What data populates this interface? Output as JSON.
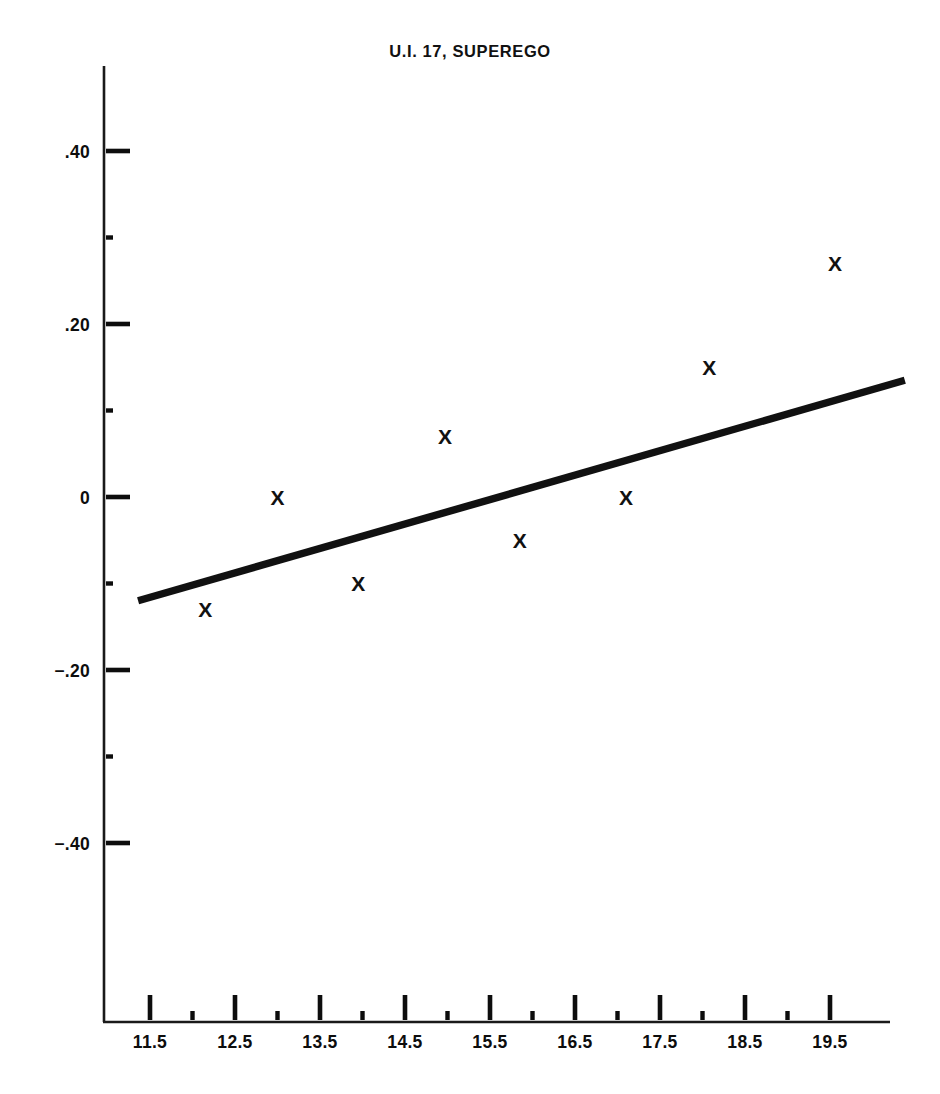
{
  "chart_data": {
    "type": "scatter",
    "title": "U.I. 17, SUPEREGO",
    "xlabel": "",
    "ylabel": "",
    "xlim": [
      11.0,
      20.4
    ],
    "ylim": [
      -0.52,
      0.47
    ],
    "grid": false,
    "legend": false,
    "marker_symbol": "X",
    "x_tick_labels": [
      "11.5",
      "12.5",
      "13.5",
      "14.5",
      "15.5",
      "16.5",
      "17.5",
      "18.5",
      "19.5"
    ],
    "x_ticks": [
      11.5,
      12.5,
      13.5,
      14.5,
      15.5,
      16.5,
      17.5,
      18.5,
      19.5
    ],
    "x_minor_ticks": [
      12.0,
      13.0,
      14.0,
      15.0,
      16.0,
      17.0,
      18.0,
      19.0
    ],
    "y_tick_labels": [
      ".40",
      ".20",
      "0",
      "−.20",
      "−.40"
    ],
    "y_ticks": [
      0.4,
      0.2,
      0.0,
      -0.2,
      -0.4
    ],
    "y_minor_ticks": [
      0.3,
      0.1,
      -0.1,
      -0.3
    ],
    "points": [
      {
        "x": 12.15,
        "y": -0.13
      },
      {
        "x": 13.0,
        "y": 0.0
      },
      {
        "x": 13.95,
        "y": -0.1
      },
      {
        "x": 14.97,
        "y": 0.07
      },
      {
        "x": 15.85,
        "y": -0.05
      },
      {
        "x": 17.1,
        "y": 0.0
      },
      {
        "x": 18.08,
        "y": 0.15
      },
      {
        "x": 19.56,
        "y": 0.27
      }
    ],
    "series": [
      {
        "name": "observations",
        "x": [
          12.15,
          13.0,
          13.95,
          14.97,
          15.85,
          17.1,
          18.08,
          19.56
        ],
        "values": [
          -0.13,
          0.0,
          -0.1,
          0.07,
          -0.05,
          0.0,
          0.15,
          0.27
        ]
      },
      {
        "name": "regression line",
        "type": "line",
        "x": [
          11.36,
          20.38
        ],
        "values": [
          -0.12,
          0.135
        ]
      }
    ],
    "colors": {
      "axis": "#1a1a1a",
      "marker": "#111111",
      "trend": "#111111",
      "background": "#ffffff"
    }
  }
}
